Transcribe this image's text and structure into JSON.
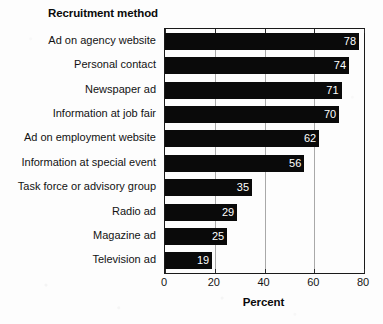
{
  "chart_data": {
    "type": "bar",
    "orientation": "horizontal",
    "title": "Recruitment method",
    "xlabel": "Percent",
    "ylabel": "",
    "categories": [
      "Ad on agency website",
      "Personal contact",
      "Newspaper ad",
      "Information at job fair",
      "Ad on employment website",
      "Information at special event",
      "Task force or advisory group",
      "Radio ad",
      "Magazine ad",
      "Television ad"
    ],
    "values": [
      78,
      74,
      71,
      70,
      62,
      56,
      35,
      29,
      25,
      19
    ],
    "value_labels": [
      "78",
      "74",
      "71",
      "70",
      "62",
      "56",
      "35",
      "29",
      "25",
      "19"
    ],
    "xlim": [
      0,
      80
    ],
    "xticks": [
      0,
      20,
      40,
      60,
      80
    ],
    "xtick_labels": [
      "0",
      "20",
      "40",
      "60",
      "80"
    ],
    "grid": "vertical-at-xticks",
    "legend": "none",
    "bar_color": "#0a0a0a",
    "value_label_color": "#ffffff",
    "background_color": "#fdfdfd",
    "gridline_color": "#a9a9a9",
    "axis_color": "#1a1a1a"
  }
}
